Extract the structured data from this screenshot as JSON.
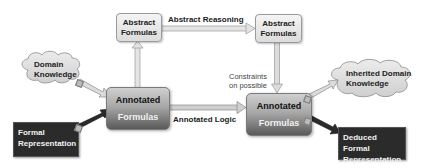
{
  "diagram": {
    "nodes": {
      "abstract_left": {
        "line1": "Abstract",
        "line2": "Formulas"
      },
      "abstract_right": {
        "line1": "Abstract",
        "line2": "Formulas"
      },
      "annotated_left": {
        "line1": "Annotated",
        "line2": "Formulas"
      },
      "annotated_right": {
        "line1": "Annotated",
        "line2": "Formulas"
      },
      "domain_knowledge": {
        "line1": "Domain",
        "line2": "Knowledge"
      },
      "inherited_domain_knowledge": {
        "line1": "Inherited Domain",
        "line2": "Knowledge"
      },
      "formal_representation": {
        "line1": "Formal",
        "line2": "Representation"
      },
      "deduced_formal_representation": {
        "line1": "Deduced Formal",
        "line2": "Representation"
      }
    },
    "edges": {
      "abstract_reasoning": "Abstract Reasoning",
      "annotated_logic": "Annotated Logic",
      "constraints_line1": "Constraints",
      "constraints_line2": "on possible"
    },
    "colors": {
      "light_box": "#e8e8e8",
      "dark_box": "#2b2b2b",
      "arrow_light": "#d0d0d0",
      "arrow_dark": "#2a2a2a",
      "cloud_fill": "#dcdcdc"
    }
  }
}
